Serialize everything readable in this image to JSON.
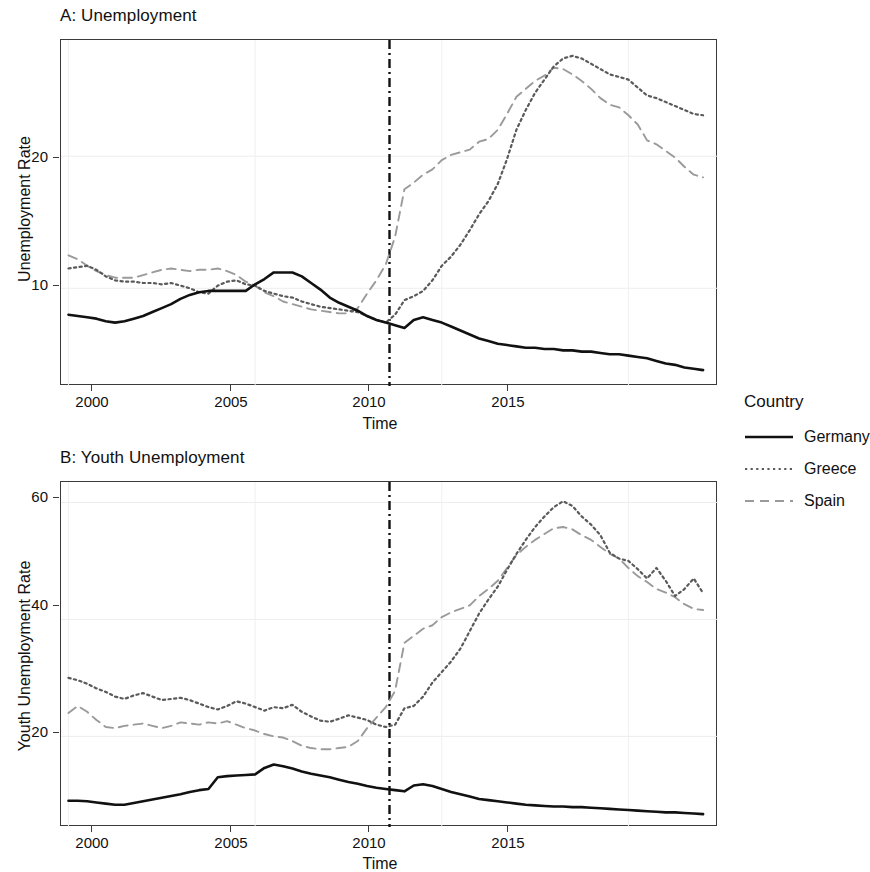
{
  "figure": {
    "x_axis_label": "Time",
    "legend_title": "Country"
  },
  "legend": {
    "title": "Country",
    "items": [
      {
        "label": "Germany",
        "style": "solid",
        "color": "#111111"
      },
      {
        "label": "Greece",
        "style": "dotted",
        "color": "#5a5a5a"
      },
      {
        "label": "Spain",
        "style": "dashed",
        "color": "#9a9a9a"
      }
    ]
  },
  "panel_a": {
    "title": "A: Unemployment",
    "ylabel": "Unemployment Rate",
    "xlabel": "Time",
    "y_ticks": [
      "10",
      "20"
    ],
    "x_ticks": [
      "2000",
      "2005",
      "2010",
      "2015"
    ]
  },
  "panel_b": {
    "title": "B: Youth Unemployment",
    "ylabel": "Youth Unemployment Rate",
    "xlabel": "Time",
    "y_ticks": [
      "20",
      "40",
      "60"
    ],
    "x_ticks": [
      "2000",
      "2005",
      "2010",
      "2015"
    ]
  },
  "chart_data": [
    {
      "type": "line",
      "panel": "A",
      "title": "A: Unemployment",
      "xlabel": "Time",
      "ylabel": "Unemployment Rate",
      "xlim": [
        1999.8,
        2017.4
      ],
      "ylim": [
        2.6,
        28.8
      ],
      "x_ticks": [
        2000,
        2005,
        2010,
        2015
      ],
      "y_ticks": [
        10,
        20
      ],
      "grid": true,
      "legend_position": "right",
      "annotations": [
        {
          "type": "vline",
          "x": 2008.6,
          "style": "dashdot",
          "color": "#111111",
          "label": "crisis onset"
        }
      ],
      "x": [
        2000.0,
        2000.25,
        2000.5,
        2000.75,
        2001.0,
        2001.25,
        2001.5,
        2001.75,
        2002.0,
        2002.25,
        2002.5,
        2002.75,
        2003.0,
        2003.25,
        2003.5,
        2003.75,
        2004.0,
        2004.25,
        2004.5,
        2004.75,
        2005.0,
        2005.25,
        2005.5,
        2005.75,
        2006.0,
        2006.25,
        2006.5,
        2006.75,
        2007.0,
        2007.25,
        2007.5,
        2007.75,
        2008.0,
        2008.25,
        2008.5,
        2008.75,
        2009.0,
        2009.25,
        2009.5,
        2009.75,
        2010.0,
        2010.25,
        2010.5,
        2010.75,
        2011.0,
        2011.25,
        2011.5,
        2011.75,
        2012.0,
        2012.25,
        2012.5,
        2012.75,
        2013.0,
        2013.25,
        2013.5,
        2013.75,
        2014.0,
        2014.25,
        2014.5,
        2014.75,
        2015.0,
        2015.25,
        2015.5,
        2015.75,
        2016.0,
        2016.25,
        2016.5,
        2016.75,
        2017.0
      ],
      "series": [
        {
          "name": "Germany",
          "style": "solid",
          "color": "#111111",
          "values": [
            8.0,
            7.9,
            7.8,
            7.7,
            7.5,
            7.4,
            7.5,
            7.7,
            7.9,
            8.2,
            8.5,
            8.8,
            9.2,
            9.5,
            9.7,
            9.8,
            9.8,
            9.8,
            9.8,
            9.8,
            10.3,
            10.7,
            11.2,
            11.2,
            11.2,
            10.9,
            10.4,
            9.9,
            9.3,
            8.9,
            8.6,
            8.3,
            7.9,
            7.6,
            7.4,
            7.2,
            7.0,
            7.6,
            7.8,
            7.6,
            7.4,
            7.1,
            6.8,
            6.5,
            6.2,
            6.0,
            5.8,
            5.7,
            5.6,
            5.5,
            5.5,
            5.4,
            5.4,
            5.3,
            5.3,
            5.2,
            5.2,
            5.1,
            5.0,
            5.0,
            4.9,
            4.8,
            4.7,
            4.5,
            4.3,
            4.2,
            4.0,
            3.9,
            3.8
          ]
        },
        {
          "name": "Greece",
          "style": "dotted",
          "color": "#5a5a5a",
          "values": [
            11.5,
            11.6,
            11.7,
            11.4,
            10.9,
            10.6,
            10.5,
            10.5,
            10.4,
            10.4,
            10.3,
            10.4,
            10.2,
            10.0,
            9.7,
            9.6,
            10.2,
            10.5,
            10.6,
            10.3,
            10.2,
            9.8,
            9.6,
            9.4,
            9.3,
            9.0,
            8.8,
            8.6,
            8.5,
            8.4,
            8.3,
            8.2,
            7.9,
            7.6,
            7.4,
            8.0,
            9.1,
            9.4,
            9.8,
            10.6,
            11.7,
            12.4,
            13.3,
            14.4,
            15.6,
            16.6,
            17.9,
            19.8,
            22.0,
            23.5,
            24.8,
            25.8,
            26.8,
            27.4,
            27.6,
            27.4,
            27.0,
            26.6,
            26.2,
            26.0,
            25.8,
            25.2,
            24.6,
            24.4,
            24.1,
            23.8,
            23.5,
            23.2,
            23.1
          ]
        },
        {
          "name": "Spain",
          "style": "dashed",
          "color": "#9a9a9a",
          "values": [
            12.5,
            12.2,
            11.7,
            11.3,
            11.0,
            10.8,
            10.8,
            10.8,
            11.0,
            11.2,
            11.4,
            11.5,
            11.4,
            11.3,
            11.4,
            11.4,
            11.5,
            11.3,
            11.0,
            10.5,
            10.2,
            9.7,
            9.4,
            9.0,
            8.8,
            8.6,
            8.4,
            8.3,
            8.2,
            8.1,
            8.1,
            8.5,
            9.6,
            10.6,
            11.8,
            13.9,
            17.5,
            18.0,
            18.6,
            19.0,
            19.7,
            20.1,
            20.3,
            20.5,
            21.1,
            21.3,
            22.0,
            23.2,
            24.5,
            25.1,
            25.7,
            26.1,
            26.7,
            26.6,
            26.2,
            25.7,
            25.1,
            24.4,
            23.9,
            23.7,
            23.1,
            22.4,
            21.2,
            20.9,
            20.4,
            19.9,
            19.2,
            18.6,
            18.4
          ]
        }
      ]
    },
    {
      "type": "line",
      "panel": "B",
      "title": "B: Youth Unemployment",
      "xlabel": "Time",
      "ylabel": "Youth Unemployment Rate",
      "xlim": [
        1999.8,
        2017.4
      ],
      "ylim": [
        4.5,
        63.5
      ],
      "x_ticks": [
        2000,
        2005,
        2010,
        2015
      ],
      "y_ticks": [
        20,
        40,
        60
      ],
      "grid": true,
      "legend_position": "right",
      "annotations": [
        {
          "type": "vline",
          "x": 2008.6,
          "style": "dashdot",
          "color": "#111111",
          "label": "crisis onset"
        }
      ],
      "x": [
        2000.0,
        2000.25,
        2000.5,
        2000.75,
        2001.0,
        2001.25,
        2001.5,
        2001.75,
        2002.0,
        2002.25,
        2002.5,
        2002.75,
        2003.0,
        2003.25,
        2003.5,
        2003.75,
        2004.0,
        2004.25,
        2004.5,
        2004.75,
        2005.0,
        2005.25,
        2005.5,
        2005.75,
        2006.0,
        2006.25,
        2006.5,
        2006.75,
        2007.0,
        2007.25,
        2007.5,
        2007.75,
        2008.0,
        2008.25,
        2008.5,
        2008.75,
        2009.0,
        2009.25,
        2009.5,
        2009.75,
        2010.0,
        2010.25,
        2010.5,
        2010.75,
        2011.0,
        2011.25,
        2011.5,
        2011.75,
        2012.0,
        2012.25,
        2012.5,
        2012.75,
        2013.0,
        2013.25,
        2013.5,
        2013.75,
        2014.0,
        2014.25,
        2014.5,
        2014.75,
        2015.0,
        2015.25,
        2015.5,
        2015.75,
        2016.0,
        2016.25,
        2016.5,
        2016.75,
        2017.0
      ],
      "series": [
        {
          "name": "Germany",
          "style": "solid",
          "color": "#111111",
          "values": [
            9.0,
            9.0,
            8.9,
            8.7,
            8.5,
            8.3,
            8.3,
            8.6,
            8.9,
            9.2,
            9.5,
            9.8,
            10.1,
            10.5,
            10.8,
            11.0,
            13.0,
            13.2,
            13.3,
            13.4,
            13.5,
            14.6,
            15.2,
            14.9,
            14.5,
            14.0,
            13.6,
            13.3,
            13.0,
            12.6,
            12.2,
            11.9,
            11.5,
            11.2,
            11.0,
            10.8,
            10.6,
            11.6,
            11.8,
            11.5,
            11.0,
            10.5,
            10.1,
            9.7,
            9.3,
            9.1,
            8.9,
            8.7,
            8.5,
            8.3,
            8.2,
            8.1,
            8.0,
            8.0,
            7.9,
            7.9,
            7.8,
            7.7,
            7.6,
            7.5,
            7.4,
            7.3,
            7.2,
            7.1,
            7.0,
            7.0,
            6.9,
            6.8,
            6.7
          ]
        },
        {
          "name": "Greece",
          "style": "dotted",
          "color": "#5a5a5a",
          "values": [
            30.0,
            29.6,
            29.0,
            28.2,
            27.6,
            26.8,
            26.4,
            27.0,
            27.4,
            26.8,
            26.2,
            26.4,
            26.6,
            26.2,
            25.6,
            25.0,
            24.6,
            25.2,
            26.0,
            25.6,
            25.0,
            24.4,
            25.0,
            24.8,
            25.4,
            24.2,
            23.4,
            22.7,
            22.5,
            23.0,
            23.6,
            23.2,
            22.8,
            22.0,
            21.6,
            22.0,
            24.8,
            25.2,
            26.8,
            29.2,
            31.0,
            32.8,
            35.0,
            38.0,
            41.0,
            43.4,
            45.6,
            48.5,
            51.2,
            53.6,
            55.8,
            57.6,
            59.2,
            60.2,
            59.4,
            57.6,
            56.2,
            54.4,
            51.4,
            50.4,
            50.0,
            48.6,
            47.0,
            48.8,
            46.6,
            44.0,
            45.2,
            47.0,
            44.5
          ]
        },
        {
          "name": "Spain",
          "style": "dashed",
          "color": "#9a9a9a",
          "values": [
            24.0,
            25.2,
            24.2,
            22.8,
            21.6,
            21.4,
            21.8,
            22.0,
            22.2,
            21.8,
            21.4,
            21.8,
            22.4,
            22.2,
            22.0,
            22.4,
            22.2,
            22.6,
            22.0,
            21.4,
            21.0,
            20.4,
            20.0,
            19.8,
            19.2,
            18.4,
            18.0,
            17.8,
            17.8,
            18.0,
            18.2,
            19.2,
            21.4,
            23.2,
            25.0,
            27.8,
            36.0,
            37.2,
            38.4,
            39.0,
            40.4,
            41.2,
            41.8,
            42.4,
            44.0,
            45.2,
            46.6,
            48.8,
            51.0,
            52.4,
            53.6,
            54.6,
            55.6,
            55.8,
            55.4,
            54.4,
            53.6,
            52.4,
            51.2,
            50.4,
            48.8,
            47.4,
            46.4,
            45.2,
            44.6,
            43.8,
            42.6,
            41.8,
            41.6
          ]
        }
      ]
    }
  ]
}
